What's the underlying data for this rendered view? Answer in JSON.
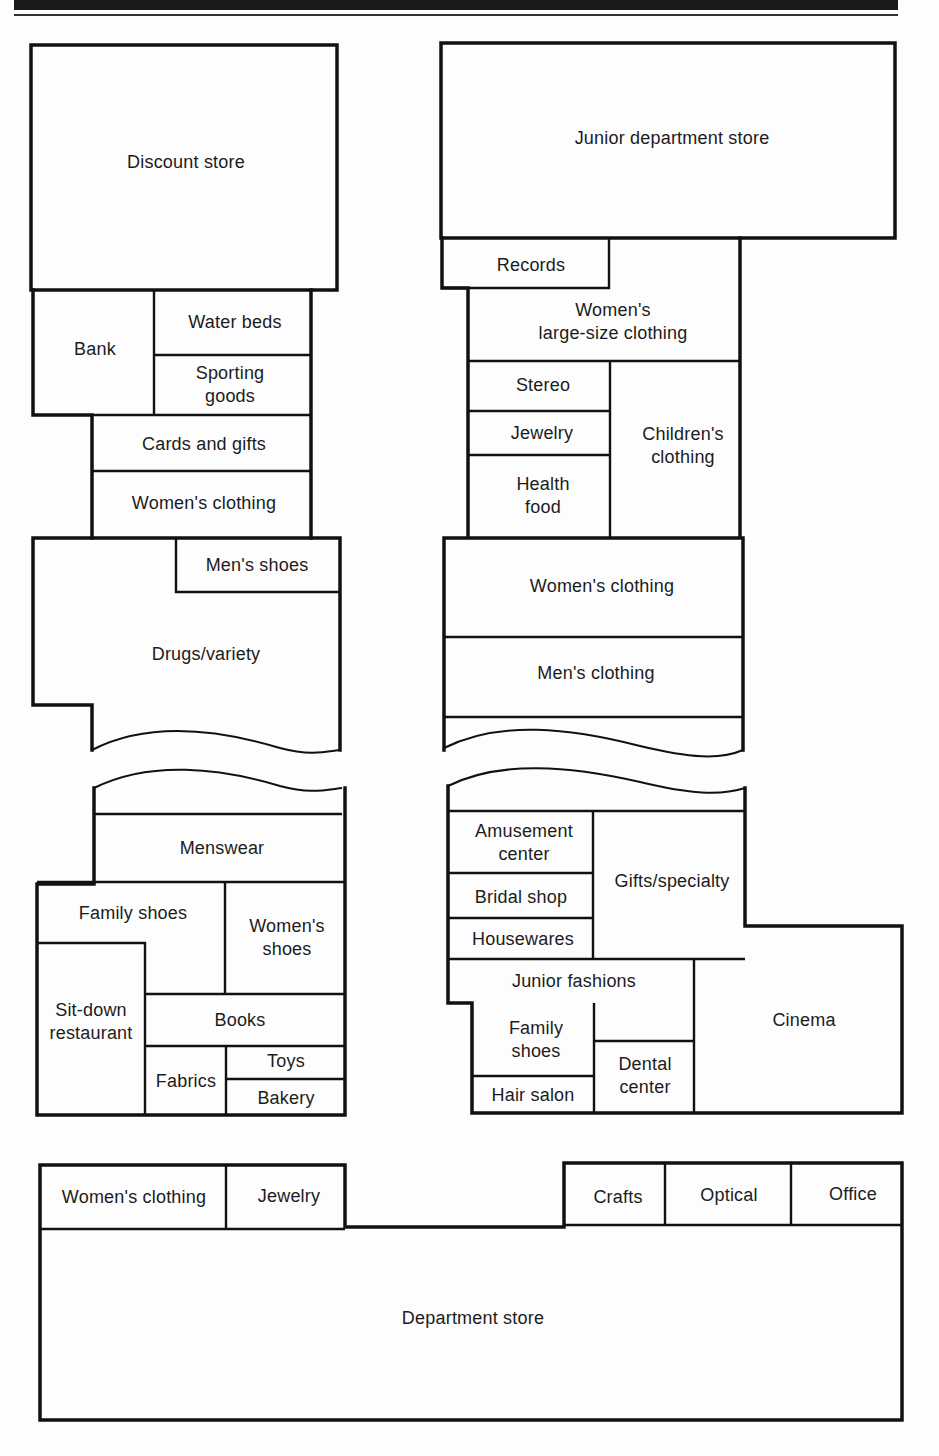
{
  "diagram": {
    "type": "shopping mall floor plan",
    "west_wing": {
      "north_block": {
        "discount_store": "Discount store",
        "bank": "Bank",
        "water_beds": "Water beds",
        "sporting_goods": [
          "Sporting",
          "goods"
        ],
        "cards_and_gifts": "Cards and gifts",
        "womens_clothing": "Women's clothing",
        "mens_shoes": "Men's shoes",
        "drugs_variety": "Drugs/variety"
      },
      "south_block": {
        "menswear": "Menswear",
        "family_shoes": "Family shoes",
        "womens_shoes": [
          "Women's",
          "shoes"
        ],
        "sit_down_restaurant": [
          "Sit-down",
          "restaurant"
        ],
        "books": "Books",
        "fabrics": "Fabrics",
        "toys": "Toys",
        "bakery": "Bakery"
      }
    },
    "east_wing": {
      "north_block": {
        "junior_department_store": "Junior department store",
        "records": "Records",
        "womens_large_size_clothing": [
          "Women's",
          "large-size clothing"
        ],
        "stereo": "Stereo",
        "jewelry": "Jewelry",
        "childrens_clothing": [
          "Children's",
          "clothing"
        ],
        "health_food": [
          "Health",
          "food"
        ],
        "womens_clothing": "Women's clothing",
        "mens_clothing": "Men's clothing"
      },
      "south_block": {
        "amusement_center": [
          "Amusement",
          "center"
        ],
        "gifts_specialty": "Gifts/specialty",
        "bridal_shop": "Bridal shop",
        "housewares": "Housewares",
        "junior_fashions": "Junior fashions",
        "cinema": "Cinema",
        "family_shoes": [
          "Family",
          "shoes"
        ],
        "dental_center": [
          "Dental",
          "center"
        ],
        "hair_salon": "Hair salon"
      }
    },
    "anchor_south": {
      "womens_clothing": "Women's clothing",
      "jewelry": "Jewelry",
      "crafts": "Crafts",
      "optical": "Optical",
      "office": "Office",
      "department_store": "Department store"
    }
  }
}
